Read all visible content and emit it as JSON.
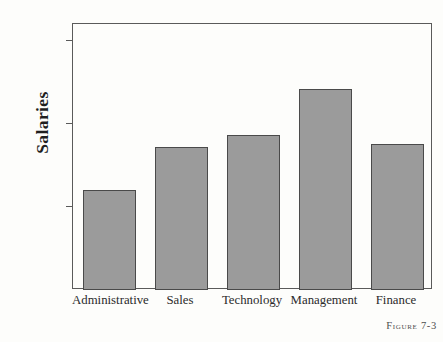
{
  "chart_data": {
    "type": "bar",
    "title": "",
    "xlabel": "",
    "ylabel": "Salaries",
    "categories": [
      "Administrative",
      "Sales",
      "Technology",
      "Management",
      "Finance"
    ],
    "values": [
      60000,
      86000,
      93000,
      121000,
      88000
    ],
    "ylim": [
      0,
      160000
    ],
    "grid": false,
    "legend": false,
    "y_ticks": [
      {
        "label": "150K",
        "value": 150000
      },
      {
        "label": "100K",
        "value": 100000
      },
      {
        "label": "50 K",
        "value": 50000
      },
      {
        "label": "0",
        "value": 0
      }
    ],
    "bar_color": "#9b9b9b",
    "bar_border_color": "#4a4a4a",
    "axis_color": "#5a5a5a",
    "background": "#fdfdfb"
  },
  "caption": {
    "text": "Figure 7-3"
  }
}
